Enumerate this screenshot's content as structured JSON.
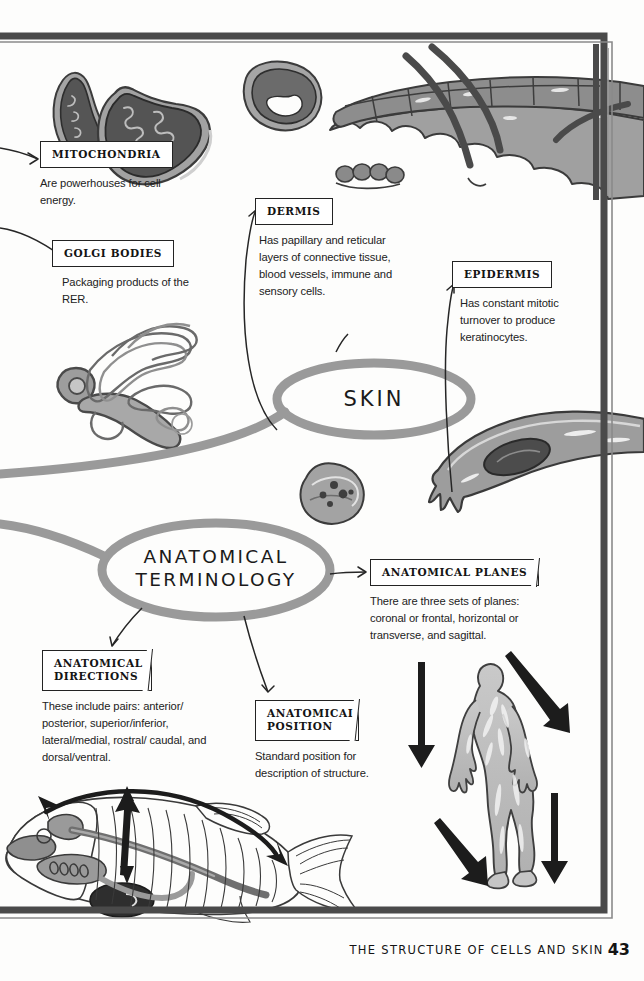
{
  "page": {
    "footer_text": "THE STRUCTURE OF CELLS AND SKIN",
    "page_number": "43",
    "background_color": "#fdfdfc",
    "frame_color": "#4a4a4a",
    "ink_color": "#232323",
    "illustration_fill": "#9b9b9b",
    "illustration_dark": "#5f5f5f",
    "bubble_stroke": "#8d8d8d"
  },
  "bubbles": [
    {
      "id": "skin",
      "label": "SKIN",
      "cx": 374,
      "cy": 399,
      "rx": 97,
      "ry": 36
    },
    {
      "id": "anatomical-terminology",
      "label": "ANATOMICAL\nTERMINOLOGY",
      "cx": 216,
      "cy": 570,
      "rx": 114,
      "ry": 47
    }
  ],
  "nodes": [
    {
      "id": "mitochondria",
      "title": "MITOCHONDRIA",
      "desc": "Are powerhouses for cell energy.",
      "x": 40,
      "y": 141,
      "desc_width": 150
    },
    {
      "id": "golgi-bodies",
      "title": "GOLGI BODIES",
      "desc": "Packaging products of the RER.",
      "x": 52,
      "y": 240,
      "desc_width": 150
    },
    {
      "id": "dermis",
      "title": "DERMIS",
      "desc": "Has papillary and reticular layers of connective tissue, blood vessels, immune and sensory cells.",
      "x": 255,
      "y": 198,
      "desc_width": 145
    },
    {
      "id": "epidermis",
      "title": "EPIDERMIS",
      "desc": "Has constant mitotic turnover to produce keratinocytes.",
      "x": 452,
      "y": 261,
      "desc_width": 140
    },
    {
      "id": "anatomical-planes",
      "title": "ANATOMICAL PLANES",
      "desc": "There are three sets of planes: coronal or frontal, horizontal or transverse, and sagittal.",
      "x": 370,
      "y": 559,
      "desc_width": 172
    },
    {
      "id": "anatomical-directions",
      "title": "ANATOMICAL\nDIRECTIONS",
      "desc": "These include pairs: anterior/ posterior, superior/inferior, lateral/medial, rostral/ caudal, and dorsal/ventral.",
      "x": 42,
      "y": 650,
      "desc_width": 170
    },
    {
      "id": "anatomical-position",
      "title": "ANATOMICAL\nPOSITION",
      "desc": "Standard position for description of structure.",
      "x": 255,
      "y": 700,
      "desc_width": 150
    }
  ],
  "illustrations": [
    {
      "id": "mitochondrion-small",
      "label": "mitochondrion-illustration"
    },
    {
      "id": "mitochondrion-large",
      "label": "mitochondrion-illustration"
    },
    {
      "id": "organelle-round",
      "label": "organelle-cross-section-illustration"
    },
    {
      "id": "skin-cross-section",
      "label": "skin-cross-section-with-hairs-illustration"
    },
    {
      "id": "golgi-apparatus",
      "label": "golgi-apparatus-illustration"
    },
    {
      "id": "cell-granules",
      "label": "granular-cell-illustration"
    },
    {
      "id": "elongated-cell",
      "label": "elongated-cell-with-nucleus-illustration"
    },
    {
      "id": "human-figure",
      "label": "human-body-anatomical-position-illustration"
    },
    {
      "id": "fish-anatomy",
      "label": "fish-anatomy-direction-illustration"
    }
  ],
  "plane_arrows": {
    "count": 4,
    "description": "four-black-directional-arrows"
  },
  "fish_arrows": {
    "count": 3,
    "description": "rostral-caudal-and-dorsal-ventral-arrows"
  }
}
